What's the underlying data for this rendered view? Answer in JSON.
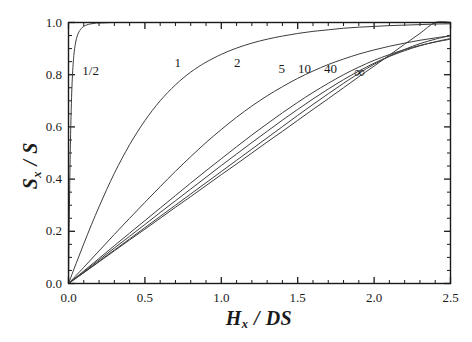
{
  "chart_data": {
    "type": "line",
    "title": "",
    "xlabel": "H_x / DS",
    "xlabel_parts": {
      "main": "H",
      "sub": "x",
      "rest": " / DS"
    },
    "ylabel": "S_x / S",
    "ylabel_parts": {
      "main": "S",
      "sub": "x",
      "rest": " / S"
    },
    "xlim": [
      0.0,
      2.5
    ],
    "ylim": [
      0.0,
      1.0
    ],
    "xticks": [
      0.0,
      0.5,
      1.0,
      1.5,
      2.0,
      2.5
    ],
    "xtick_labels": [
      "0.0",
      "0.5",
      "1.0",
      "1.5",
      "2.0",
      "2.5"
    ],
    "xminor_step": 0.1,
    "yticks": [
      0.0,
      0.2,
      0.4,
      0.6,
      0.8,
      1.0
    ],
    "ytick_labels": [
      "0.0",
      "0.2",
      "0.4",
      "0.6",
      "0.8",
      "1.0"
    ],
    "yminor_step": 0.05,
    "grid": false,
    "legend_position": "inline-annotations",
    "tick_direction": "in",
    "frame": "box",
    "line_color": "#3d3d3d",
    "axis_color": "#1a1a1a",
    "background": "#ffffff",
    "annotations": [
      {
        "text": "1/2",
        "x": 0.145,
        "y": 0.815
      },
      {
        "text": "1",
        "x": 0.715,
        "y": 0.845
      },
      {
        "text": "2",
        "x": 1.105,
        "y": 0.845
      },
      {
        "text": "5",
        "x": 1.395,
        "y": 0.82
      },
      {
        "text": "10",
        "x": 1.545,
        "y": 0.82
      },
      {
        "text": "40",
        "x": 1.715,
        "y": 0.82
      },
      {
        "text": "∞",
        "x": 1.905,
        "y": 0.81
      }
    ],
    "series": [
      {
        "name": "1/2",
        "label": "1/2",
        "x": [
          0.0,
          0.005,
          0.01,
          0.015,
          0.02,
          0.025,
          0.03,
          0.035,
          0.04,
          0.05,
          0.06,
          0.07,
          0.08,
          0.09,
          0.1,
          0.12,
          0.14,
          0.16,
          0.18,
          0.2,
          0.25,
          0.3,
          0.4,
          0.5,
          0.7,
          1.0,
          1.5,
          2.0,
          2.5
        ],
        "y": [
          0.0,
          0.245,
          0.452,
          0.604,
          0.712,
          0.787,
          0.838,
          0.874,
          0.9,
          0.933,
          0.953,
          0.966,
          0.974,
          0.981,
          0.985,
          0.991,
          0.994,
          0.996,
          0.998,
          0.998,
          0.999,
          1.0,
          1.0,
          1.0,
          1.0,
          1.0,
          1.0,
          1.0,
          1.0
        ]
      },
      {
        "name": "1",
        "label": "1",
        "x": [
          0.0,
          0.05,
          0.1,
          0.15,
          0.2,
          0.25,
          0.3,
          0.35,
          0.4,
          0.45,
          0.5,
          0.55,
          0.6,
          0.65,
          0.7,
          0.75,
          0.8,
          0.85,
          0.9,
          1.0,
          1.1,
          1.2,
          1.3,
          1.4,
          1.5,
          1.6,
          1.7,
          1.8,
          1.9,
          2.0,
          2.1,
          2.2,
          2.3,
          2.4,
          2.5
        ],
        "y": [
          0.0,
          0.077,
          0.152,
          0.225,
          0.294,
          0.36,
          0.422,
          0.479,
          0.532,
          0.58,
          0.624,
          0.664,
          0.7,
          0.732,
          0.761,
          0.787,
          0.81,
          0.83,
          0.848,
          0.878,
          0.902,
          0.921,
          0.936,
          0.948,
          0.958,
          0.966,
          0.972,
          0.978,
          0.982,
          0.985,
          0.988,
          0.99,
          0.992,
          0.994,
          0.995
        ]
      },
      {
        "name": "2",
        "label": "2",
        "x": [
          0.0,
          0.1,
          0.2,
          0.3,
          0.4,
          0.5,
          0.6,
          0.7,
          0.8,
          0.9,
          1.0,
          1.1,
          1.2,
          1.3,
          1.4,
          1.5,
          1.6,
          1.7,
          1.8,
          1.9,
          2.0,
          2.1,
          2.2,
          2.3,
          2.4,
          2.5
        ],
        "y": [
          0.0,
          0.062,
          0.125,
          0.188,
          0.25,
          0.311,
          0.371,
          0.43,
          0.486,
          0.54,
          0.59,
          0.637,
          0.68,
          0.719,
          0.754,
          0.786,
          0.814,
          0.839,
          0.86,
          0.879,
          0.895,
          0.909,
          0.921,
          0.932,
          0.941,
          0.949
        ]
      },
      {
        "name": "5",
        "label": "5",
        "x": [
          0.0,
          0.1,
          0.2,
          0.3,
          0.4,
          0.5,
          0.6,
          0.7,
          0.8,
          0.9,
          1.0,
          1.1,
          1.2,
          1.3,
          1.4,
          1.5,
          1.6,
          1.7,
          1.8,
          1.9,
          2.0,
          2.1,
          2.2,
          2.3,
          2.4,
          2.5
        ],
        "y": [
          0.0,
          0.048,
          0.096,
          0.145,
          0.193,
          0.241,
          0.289,
          0.337,
          0.385,
          0.432,
          0.478,
          0.524,
          0.569,
          0.612,
          0.654,
          0.694,
          0.732,
          0.767,
          0.8,
          0.829,
          0.855,
          0.877,
          0.896,
          0.912,
          0.925,
          0.936
        ]
      },
      {
        "name": "10",
        "label": "10",
        "x": [
          0.0,
          0.1,
          0.2,
          0.3,
          0.4,
          0.5,
          0.6,
          0.7,
          0.8,
          0.9,
          1.0,
          1.1,
          1.2,
          1.3,
          1.4,
          1.5,
          1.6,
          1.7,
          1.8,
          1.9,
          2.0,
          2.1,
          2.2,
          2.3,
          2.4,
          2.5
        ],
        "y": [
          0.0,
          0.045,
          0.09,
          0.136,
          0.181,
          0.226,
          0.272,
          0.317,
          0.362,
          0.407,
          0.452,
          0.496,
          0.54,
          0.583,
          0.626,
          0.667,
          0.707,
          0.745,
          0.781,
          0.814,
          0.844,
          0.87,
          0.892,
          0.911,
          0.926,
          0.939
        ]
      },
      {
        "name": "40",
        "label": "40",
        "x": [
          0.0,
          0.1,
          0.2,
          0.3,
          0.4,
          0.5,
          0.6,
          0.7,
          0.8,
          0.9,
          1.0,
          1.1,
          1.2,
          1.3,
          1.4,
          1.5,
          1.6,
          1.7,
          1.8,
          1.9,
          2.0,
          2.1,
          2.2,
          2.3,
          2.4,
          2.5
        ],
        "y": [
          0.0,
          0.042,
          0.085,
          0.128,
          0.171,
          0.214,
          0.257,
          0.3,
          0.343,
          0.386,
          0.429,
          0.472,
          0.515,
          0.558,
          0.601,
          0.644,
          0.686,
          0.727,
          0.767,
          0.805,
          0.84,
          0.871,
          0.897,
          0.919,
          0.936,
          0.95
        ]
      },
      {
        "name": "inf",
        "label": "∞",
        "x": [
          0.0,
          0.1,
          0.2,
          0.3,
          0.4,
          0.5,
          0.6,
          0.7,
          0.8,
          0.9,
          1.0,
          1.1,
          1.2,
          1.3,
          1.4,
          1.5,
          1.6,
          1.7,
          1.8,
          1.9,
          2.0,
          2.1,
          2.2,
          2.3,
          2.4,
          2.5
        ],
        "y": [
          0.0,
          0.041,
          0.083,
          0.125,
          0.167,
          0.208,
          0.25,
          0.292,
          0.333,
          0.375,
          0.417,
          0.458,
          0.5,
          0.542,
          0.583,
          0.625,
          0.667,
          0.708,
          0.75,
          0.792,
          0.833,
          0.875,
          0.917,
          0.958,
          1.0,
          1.0
        ]
      }
    ]
  }
}
